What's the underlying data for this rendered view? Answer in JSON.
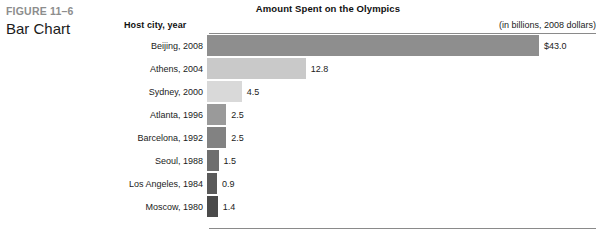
{
  "figure": {
    "number": "FIGURE 11–6",
    "title": "Bar Chart"
  },
  "chart_data": {
    "type": "bar",
    "orientation": "horizontal",
    "title": "Amount Spent on the Olympics",
    "subtitle": "(in billions, 2008 dollars)",
    "category_header": "Host city, year",
    "xlabel": "",
    "ylabel": "Host city, year",
    "xlim": [
      0,
      43.0
    ],
    "grid": false,
    "legend": "none",
    "categories": [
      "Beijing, 2008",
      "Athens, 2004",
      "Sydney, 2000",
      "Atlanta, 1996",
      "Barcelona, 1992",
      "Seoul, 1988",
      "Los Angeles, 1984",
      "Moscow, 1980"
    ],
    "values": [
      43.0,
      12.8,
      4.5,
      2.5,
      2.5,
      1.5,
      0.9,
      1.4
    ],
    "value_labels": [
      "$43.0",
      "12.8",
      "4.5",
      "2.5",
      "2.5",
      "1.5",
      "0.9",
      "1.4"
    ],
    "bar_colors": [
      "#8e8e8e",
      "#c9c9c9",
      "#d9d9d9",
      "#9a9a9a",
      "#828282",
      "#6e6e6e",
      "#5a5a5a",
      "#4a4a4a"
    ],
    "bars": [
      {
        "category": "Beijing, 2008",
        "value": 43.0,
        "label": "$43.0",
        "color": "#8e8e8e"
      },
      {
        "category": "Athens, 2004",
        "value": 12.8,
        "label": "12.8",
        "color": "#c9c9c9"
      },
      {
        "category": "Sydney, 2000",
        "value": 4.5,
        "label": "4.5",
        "color": "#d9d9d9"
      },
      {
        "category": "Atlanta, 1996",
        "value": 2.5,
        "label": "2.5",
        "color": "#9a9a9a"
      },
      {
        "category": "Barcelona, 1992",
        "value": 2.5,
        "label": "2.5",
        "color": "#828282"
      },
      {
        "category": "Seoul, 1988",
        "value": 1.5,
        "label": "1.5",
        "color": "#6e6e6e"
      },
      {
        "category": "Los Angeles, 1984",
        "value": 0.9,
        "label": "0.9",
        "color": "#5a5a5a"
      },
      {
        "category": "Moscow, 1980",
        "value": 1.4,
        "label": "1.4",
        "color": "#4a4a4a"
      }
    ]
  },
  "layout": {
    "px_per_unit": 7.72,
    "min_bar_px": 10,
    "rule_color": "#8a8a8a"
  }
}
